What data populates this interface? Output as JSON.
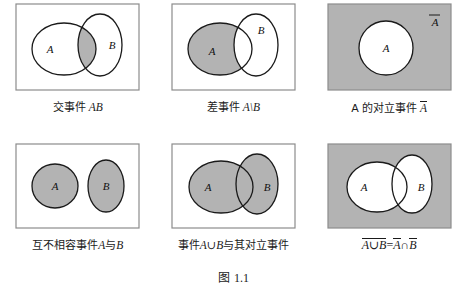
{
  "figure": {
    "number_prefix": "图",
    "number": "1.1",
    "colors": {
      "shade_gray": "#b3b3b3",
      "outline": "#1a1a1a",
      "frame": "#8c8c8c",
      "background": "#ffffff"
    }
  },
  "panels": [
    {
      "id": "intersection",
      "caption_cjk": "交事件",
      "caption_math": "AB",
      "label_a": "A",
      "label_b": "B",
      "shaded_region": "A∩B"
    },
    {
      "id": "difference",
      "caption_cjk": "差事件",
      "caption_math": "A\\B",
      "label_a": "A",
      "label_b": "B",
      "shaded_region": "A\\B"
    },
    {
      "id": "complement",
      "caption_cjk_prefix": "A 的对立事件",
      "caption_math": "A",
      "label_a": "A",
      "label_outside": "A",
      "shaded_region": "complement of A"
    },
    {
      "id": "mutually-exclusive",
      "caption_cjk": "互不相容事件",
      "caption_math_a": "A",
      "caption_cjk_mid": "与",
      "caption_math_b": "B",
      "label_a": "A",
      "label_b": "B",
      "shaded_region": "A and B both"
    },
    {
      "id": "union",
      "caption_cjk_prefix": "事件",
      "caption_math": "A∪B",
      "caption_cjk_suffix": "与其对立事件",
      "label_a": "A",
      "label_b": "B",
      "shaded_region": "A∪B"
    },
    {
      "id": "de-morgan",
      "label_a": "A",
      "label_b": "B",
      "shaded_region": "complement of A∪B",
      "formula": {
        "lhs_inner": "A∪B",
        "equals": "=",
        "rhs_a": "A",
        "rhs_op": "∩",
        "rhs_b": "B"
      }
    }
  ]
}
